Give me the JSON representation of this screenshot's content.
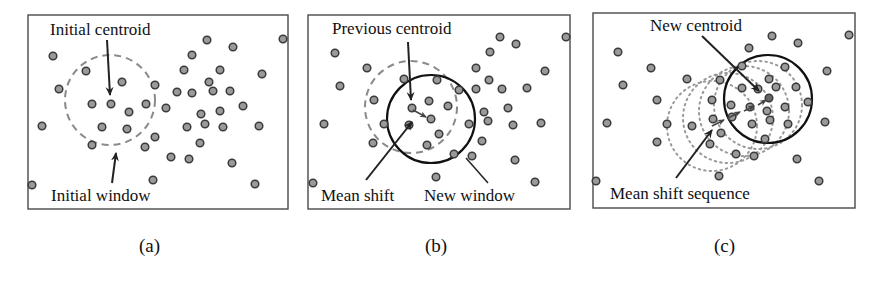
{
  "figure": {
    "panels": [
      {
        "id": "a",
        "caption": "(a)",
        "labels": {
          "top": "Initial centroid",
          "bottom": "Initial window"
        }
      },
      {
        "id": "b",
        "caption": "(b)",
        "labels": {
          "top": "Previous centroid",
          "bottom_left": "Mean shift",
          "bottom_right": "New window"
        }
      },
      {
        "id": "c",
        "caption": "(c)",
        "labels": {
          "top": "New centroid",
          "bottom": "Mean shift sequence"
        }
      }
    ],
    "colors": {
      "dot_fill": "#9a9a9a",
      "dot_stroke": "#3a3a3a",
      "border": "#555555",
      "dashed_window": "#8a8a8a",
      "solid_window": "#111111",
      "dotted_window": "#9a9a9a",
      "arrow": "#222222"
    }
  }
}
